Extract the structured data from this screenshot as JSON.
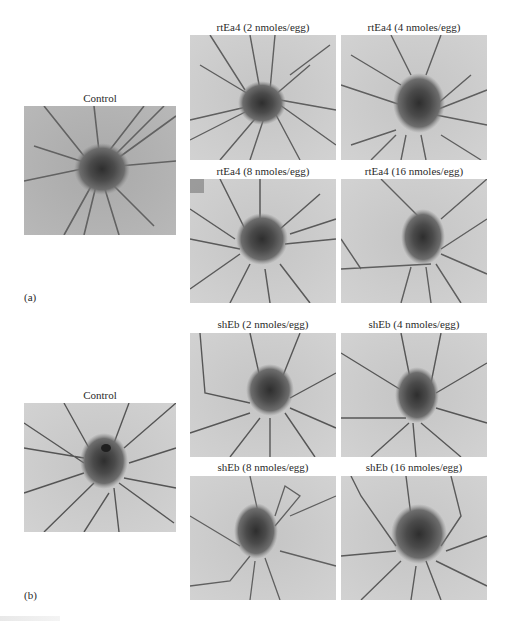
{
  "figure": {
    "panel_a": {
      "tag": "(a)",
      "control": {
        "label": "Control"
      },
      "treatments": [
        {
          "label": "rtEa4 (2 nmoles/egg)"
        },
        {
          "label": "rtEa4 (4 nmoles/egg)"
        },
        {
          "label": "rtEa4 (8 nmoles/egg)"
        },
        {
          "label": "rtEa4 (16 nmoles/egg)"
        }
      ]
    },
    "panel_b": {
      "tag": "(b)",
      "control": {
        "label": "Control"
      },
      "treatments": [
        {
          "label": "shEb (2 nmoles/egg)"
        },
        {
          "label": "shEb (4 nmoles/egg)"
        },
        {
          "label": "shEb (8 nmoles/egg)"
        },
        {
          "label": "shEb (16 nmoles/egg)"
        }
      ]
    },
    "image_style": {
      "background": "#c9c9c9",
      "blob": "#4a4a4a",
      "vessel": "#5a5a5a"
    }
  }
}
